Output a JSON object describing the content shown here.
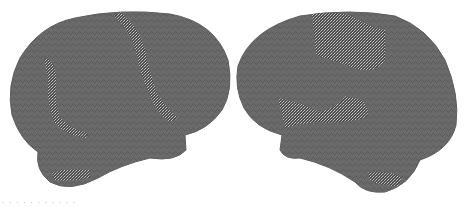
{
  "figure": {
    "panels": [
      {
        "id": "left-hemisphere",
        "view": "lateral",
        "surface_color": "#6a6a6a"
      },
      {
        "id": "right-hemisphere",
        "view": "lateral",
        "surface_color": "#6a6a6a"
      }
    ],
    "highlight_texture": "speckled",
    "caption": "· · · · · · ·   ·   ·   ·   ·"
  }
}
